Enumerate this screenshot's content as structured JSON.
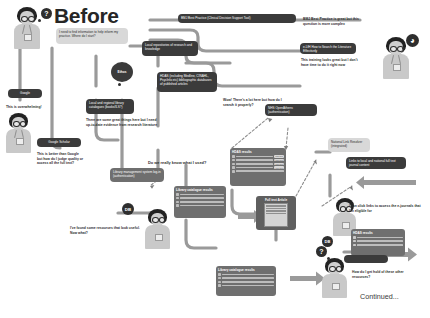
{
  "meta": {
    "title": "Before",
    "continued_label": "Continued...",
    "colors": {
      "dark_node": "#3b3b3b",
      "mid_node": "#6f6f6f",
      "light_node": "#d8d8d8",
      "wire": "#9a9a9a",
      "text_dark": "#2e2e2e",
      "background": "#ffffff"
    }
  },
  "nodes": {
    "need_info": "I need to find information to help inform my practice. Where do I start?",
    "bmj_best_practice": "BMJ Best Practice (Clinical Decision Support Tool)",
    "local_repositories": "Local repositories of research and knowledge",
    "elfh_training": "e-LfH How to Search the Literature Effectively",
    "hdas_databases": "HDAS (including Medline, CINAHL, PsycInfo etc) bibliographic databases of published articles",
    "google": "Google",
    "google_scholar": "Google Scholar",
    "ethos": "Ethos",
    "local_library_catalogues": "Local and regional library catalogues (books/ILS?)",
    "nhs_openathens": "NHS OpenAthens (authentication)",
    "national_link_resolver": "National Link Resolver (integrated)",
    "links_fulltext": "Links to local and national full text journal content",
    "library_mgmt_login": "Library management system log-in (authentication)",
    "hdas_results_1": "HDAS results",
    "hdas_results_2": "HDAS results",
    "library_catalogue_results_1": "Library catalogue results",
    "library_catalogue_results_2": "Library catalogue results",
    "full_text_article": "Full text Article",
    "full_text_button": "Full text"
  },
  "speech": {
    "overwhelming": "This is overwhelming!",
    "better_than_google": "This is better than Google but how do I judge quality or access all the full text?",
    "bmj_complex": "BMJ Best Practice is great but this question is more complex",
    "training_no_time": "This training looks great but I don't have time to do it right now",
    "wow_search": "Wow! There's a lot here but how do I search it properly?",
    "great_things": "There are some great things here but I need up-to-date evidence from research literature",
    "do_we_know": "Do we really know what I used?",
    "found_resources": "I've found some resources that look useful. Now what?",
    "can_click_links": "I can click links to access the e-journals that I'm eligible for",
    "get_hold": "How do I get hold of these other resources?"
  },
  "badges": {
    "db_label": "DB",
    "question_mark": "?",
    "clock": "◕"
  }
}
